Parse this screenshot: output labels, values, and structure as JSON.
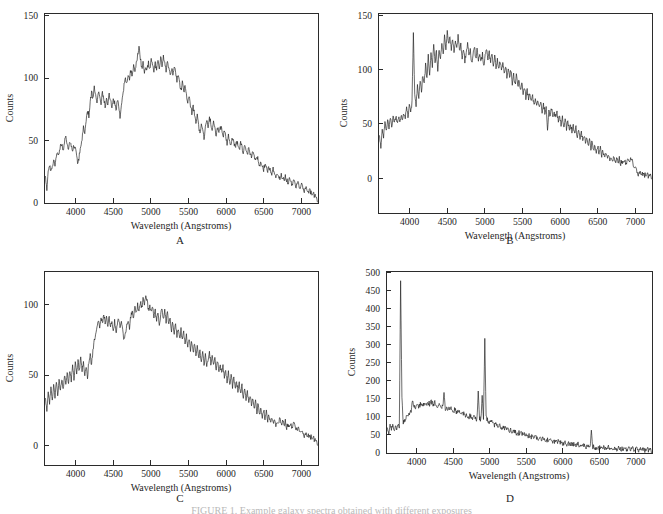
{
  "figure": {
    "background_color": "#ffffff",
    "line_color": "#1a1a1a",
    "axis_color": "#2b2b2b",
    "caption_partial": "FIGURE 1. Example galaxy spectra obtained with different exposures"
  },
  "axis_titles": {
    "x": "Wavelength  (Angstroms)",
    "y": "Counts"
  },
  "panel_labels": {
    "a": "A",
    "b": "B",
    "c": "C",
    "d": "D"
  },
  "chart_data": [
    {
      "id": "panel-a",
      "type": "line",
      "title": "A",
      "xlabel": "Wavelength  (Angstroms)",
      "ylabel": "Counts",
      "xlim": [
        3580,
        7220
      ],
      "ylim": [
        0,
        152
      ],
      "xticks": [
        4000,
        4500,
        5000,
        5500,
        6000,
        6500,
        7000
      ],
      "yticks": [
        0,
        50,
        100,
        150
      ],
      "grid": false,
      "legend": "none",
      "x_start": 3600,
      "x_step": 18,
      "values": [
        22,
        12,
        26,
        30,
        24,
        29,
        33,
        30,
        36,
        41,
        38,
        45,
        48,
        42,
        49,
        52,
        47,
        43,
        50,
        46,
        40,
        47,
        43,
        37,
        31,
        38,
        44,
        52,
        60,
        56,
        66,
        74,
        70,
        80,
        88,
        84,
        92,
        88,
        82,
        90,
        86,
        80,
        88,
        84,
        78,
        84,
        80,
        86,
        82,
        76,
        84,
        80,
        74,
        82,
        78,
        68,
        78,
        86,
        94,
        100,
        96,
        104,
        100,
        106,
        102,
        110,
        104,
        112,
        118,
        126,
        116,
        108,
        112,
        104,
        110,
        106,
        112,
        108,
        114,
        110,
        104,
        112,
        106,
        114,
        108,
        116,
        110,
        118,
        112,
        106,
        112,
        108,
        102,
        108,
        104,
        110,
        104,
        98,
        104,
        96,
        90,
        96,
        88,
        94,
        86,
        80,
        86,
        78,
        72,
        78,
        70,
        64,
        70,
        62,
        56,
        64,
        58,
        52,
        60,
        66,
        62,
        68,
        64,
        58,
        64,
        60,
        54,
        60,
        56,
        62,
        58,
        52,
        58,
        54,
        48,
        54,
        50,
        46,
        52,
        48,
        44,
        50,
        46,
        42,
        48,
        44,
        40,
        46,
        42,
        38,
        44,
        40,
        36,
        42,
        38,
        34,
        38,
        34,
        30,
        34,
        30,
        27,
        31,
        28,
        25,
        29,
        26,
        23,
        27,
        24,
        21,
        25,
        22,
        19,
        23,
        20,
        18,
        21,
        19,
        16,
        19,
        17,
        15,
        18,
        16,
        13,
        16,
        14,
        12,
        14,
        12,
        10,
        12,
        10,
        8,
        10,
        8,
        6,
        7,
        5,
        3
      ]
    },
    {
      "id": "panel-b",
      "type": "line",
      "title": "B",
      "xlabel": "Wavelength  (Angstroms)",
      "ylabel": "Counts",
      "xlim": [
        3580,
        7220
      ],
      "ylim": [
        -32,
        152
      ],
      "xticks": [
        4000,
        4500,
        5000,
        5500,
        6000,
        6500,
        7000
      ],
      "yticks": [
        0,
        50,
        100,
        150
      ],
      "grid": false,
      "legend": "none",
      "x_start": 3600,
      "x_step": 18,
      "values": [
        40,
        30,
        45,
        38,
        50,
        44,
        52,
        46,
        54,
        48,
        56,
        50,
        58,
        52,
        56,
        50,
        58,
        54,
        60,
        56,
        64,
        58,
        66,
        60,
        70,
        134,
        76,
        68,
        84,
        74,
        90,
        80,
        96,
        86,
        104,
        92,
        112,
        96,
        118,
        104,
        124,
        108,
        116,
        100,
        120,
        110,
        126,
        112,
        132,
        118,
        136,
        122,
        130,
        118,
        128,
        116,
        126,
        120,
        130,
        118,
        124,
        112,
        120,
        108,
        116,
        124,
        112,
        118,
        106,
        114,
        122,
        110,
        118,
        108,
        116,
        106,
        114,
        104,
        112,
        118,
        108,
        116,
        106,
        114,
        104,
        112,
        102,
        110,
        100,
        108,
        98,
        106,
        96,
        104,
        94,
        102,
        92,
        100,
        88,
        96,
        86,
        94,
        84,
        90,
        80,
        88,
        78,
        84,
        74,
        82,
        72,
        78,
        70,
        76,
        68,
        74,
        66,
        72,
        64,
        70,
        62,
        68,
        60,
        66,
        42,
        62,
        58,
        64,
        56,
        62,
        54,
        60,
        52,
        58,
        50,
        56,
        48,
        54,
        46,
        52,
        44,
        50,
        42,
        48,
        40,
        46,
        38,
        44,
        36,
        42,
        34,
        40,
        32,
        38,
        30,
        36,
        28,
        34,
        26,
        32,
        24,
        30,
        22,
        28,
        20,
        26,
        19,
        24,
        18,
        22,
        17,
        21,
        16,
        20,
        15,
        19,
        14,
        18,
        14,
        17,
        13,
        16,
        14,
        17,
        15,
        18,
        16,
        14,
        10,
        8,
        6,
        4,
        5,
        3,
        4,
        2,
        3,
        2,
        3,
        1,
        2
      ]
    },
    {
      "id": "panel-c",
      "type": "line",
      "title": "C",
      "xlabel": "Wavelength  (Angstroms)",
      "ylabel": "Counts",
      "xlim": [
        3580,
        7220
      ],
      "ylim": [
        -14,
        124
      ],
      "xticks": [
        4000,
        4500,
        5000,
        5500,
        6000,
        6500,
        7000
      ],
      "yticks": [
        0,
        50,
        100
      ],
      "grid": false,
      "legend": "none",
      "x_start": 3600,
      "x_step": 18,
      "values": [
        34,
        26,
        38,
        30,
        40,
        32,
        42,
        34,
        44,
        36,
        46,
        38,
        48,
        40,
        50,
        42,
        52,
        44,
        54,
        46,
        56,
        48,
        58,
        50,
        60,
        52,
        62,
        54,
        58,
        50,
        56,
        48,
        60,
        64,
        56,
        68,
        74,
        80,
        86,
        90,
        84,
        92,
        86,
        94,
        88,
        92,
        86,
        90,
        84,
        88,
        82,
        88,
        80,
        86,
        90,
        84,
        88,
        82,
        74,
        80,
        86,
        90,
        84,
        92,
        96,
        90,
        98,
        94,
        100,
        96,
        102,
        98,
        104,
        100,
        108,
        102,
        96,
        100,
        94,
        98,
        90,
        96,
        88,
        94,
        86,
        92,
        98,
        90,
        96,
        88,
        94,
        86,
        90,
        82,
        88,
        80,
        86,
        78,
        84,
        76,
        82,
        74,
        80,
        72,
        78,
        70,
        76,
        68,
        74,
        66,
        72,
        64,
        70,
        62,
        68,
        60,
        66,
        58,
        64,
        56,
        62,
        66,
        58,
        64,
        56,
        62,
        54,
        60,
        52,
        58,
        50,
        56,
        48,
        54,
        46,
        52,
        44,
        50,
        42,
        48,
        40,
        46,
        38,
        44,
        36,
        42,
        34,
        40,
        32,
        38,
        30,
        36,
        28,
        34,
        26,
        32,
        24,
        30,
        22,
        28,
        20,
        26,
        18,
        24,
        17,
        22,
        16,
        20,
        15,
        19,
        14,
        18,
        16,
        20,
        15,
        18,
        14,
        17,
        13,
        16,
        12,
        15,
        13,
        16,
        14,
        12,
        10,
        12,
        10,
        8,
        9,
        7,
        8,
        6,
        7,
        5,
        6,
        4,
        5,
        3,
        2
      ]
    },
    {
      "id": "panel-d",
      "type": "line",
      "title": "D",
      "xlabel": "Wavelength  (Angstroms)",
      "ylabel": "Counts",
      "xlim": [
        3580,
        7220
      ],
      "ylim": [
        0,
        505
      ],
      "xticks": [
        4000,
        4500,
        5000,
        5500,
        6000,
        6500,
        7000
      ],
      "yticks": [
        0,
        50,
        100,
        150,
        200,
        250,
        300,
        350,
        400,
        450,
        500
      ],
      "grid": false,
      "legend": "none",
      "emission_lines": [
        {
          "wavelength": 3727,
          "peak": 478,
          "label": "[OII] 3727"
        },
        {
          "wavelength": 4340,
          "peak": 168,
          "label": "Hgamma 4340"
        },
        {
          "wavelength": 4861,
          "peak": 172,
          "label": "Hbeta 4861"
        },
        {
          "wavelength": 4959,
          "peak": 160,
          "label": "[OIII] 4959"
        },
        {
          "wavelength": 5007,
          "peak": 318,
          "label": "[OIII] 5007"
        },
        {
          "wavelength": 6563,
          "peak": 62,
          "label": "Halpha 6563"
        }
      ],
      "x_start": 3600,
      "x_step": 18,
      "values": [
        72,
        58,
        80,
        66,
        74,
        62,
        70,
        66,
        74,
        72,
        478,
        150,
        86,
        92,
        96,
        100,
        106,
        112,
        118,
        148,
        124,
        130,
        126,
        132,
        128,
        134,
        130,
        136,
        132,
        138,
        134,
        140,
        136,
        142,
        138,
        134,
        140,
        136,
        132,
        138,
        134,
        130,
        126,
        168,
        124,
        128,
        124,
        120,
        124,
        120,
        116,
        120,
        116,
        112,
        116,
        112,
        108,
        112,
        108,
        104,
        108,
        104,
        100,
        104,
        100,
        96,
        100,
        96,
        92,
        172,
        96,
        92,
        160,
        94,
        318,
        96,
        92,
        88,
        84,
        86,
        82,
        78,
        80,
        76,
        74,
        76,
        72,
        70,
        72,
        68,
        66,
        68,
        64,
        62,
        64,
        60,
        58,
        60,
        56,
        54,
        56,
        52,
        54,
        50,
        52,
        48,
        50,
        46,
        48,
        44,
        46,
        42,
        44,
        46,
        42,
        40,
        42,
        38,
        40,
        36,
        38,
        34,
        36,
        38,
        34,
        32,
        34,
        30,
        32,
        34,
        30,
        28,
        30,
        26,
        28,
        30,
        26,
        24,
        26,
        22,
        24,
        26,
        22,
        20,
        22,
        24,
        20,
        18,
        20,
        22,
        18,
        16,
        18,
        20,
        16,
        62,
        18,
        16,
        14,
        16,
        18,
        14,
        16,
        12,
        14,
        16,
        12,
        14,
        16,
        12,
        14,
        16,
        12,
        14,
        10,
        12,
        14,
        10,
        12,
        14,
        10,
        12,
        10,
        12,
        14,
        10,
        12,
        10,
        8,
        10,
        12,
        8,
        10,
        8,
        10,
        8,
        6,
        8,
        10,
        6,
        8
      ]
    }
  ]
}
